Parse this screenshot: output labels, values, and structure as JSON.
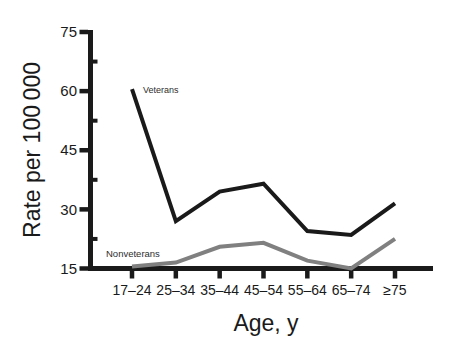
{
  "chart_data": {
    "type": "line",
    "title": "",
    "categories": [
      "17–24",
      "25–34",
      "35–44",
      "45–54",
      "55–64",
      "65–74",
      "≥75"
    ],
    "series": [
      {
        "name": "Veterans",
        "color": "#1a1a1a",
        "values": [
          60.5,
          27,
          34.5,
          36.5,
          24.5,
          23.5,
          31.5
        ]
      },
      {
        "name": "Nonveterans",
        "color": "#808080",
        "values": [
          15.5,
          16.5,
          20.5,
          21.5,
          17,
          15,
          22.5
        ]
      }
    ],
    "xlabel": "Age, y",
    "ylabel": "Rate per 100 000",
    "ylim": [
      15,
      75
    ],
    "y_major_ticks": [
      15,
      30,
      45,
      60,
      75
    ],
    "y_minor_ticks": [
      22.5,
      37.5,
      52.5,
      67.5
    ],
    "grid": false,
    "legend_position": "inline-labels-on-lines"
  },
  "colors": {
    "axis": "#1a1a1a",
    "background": "#ffffff",
    "veterans_line": "#1a1a1a",
    "nonveterans_line": "#808080"
  }
}
